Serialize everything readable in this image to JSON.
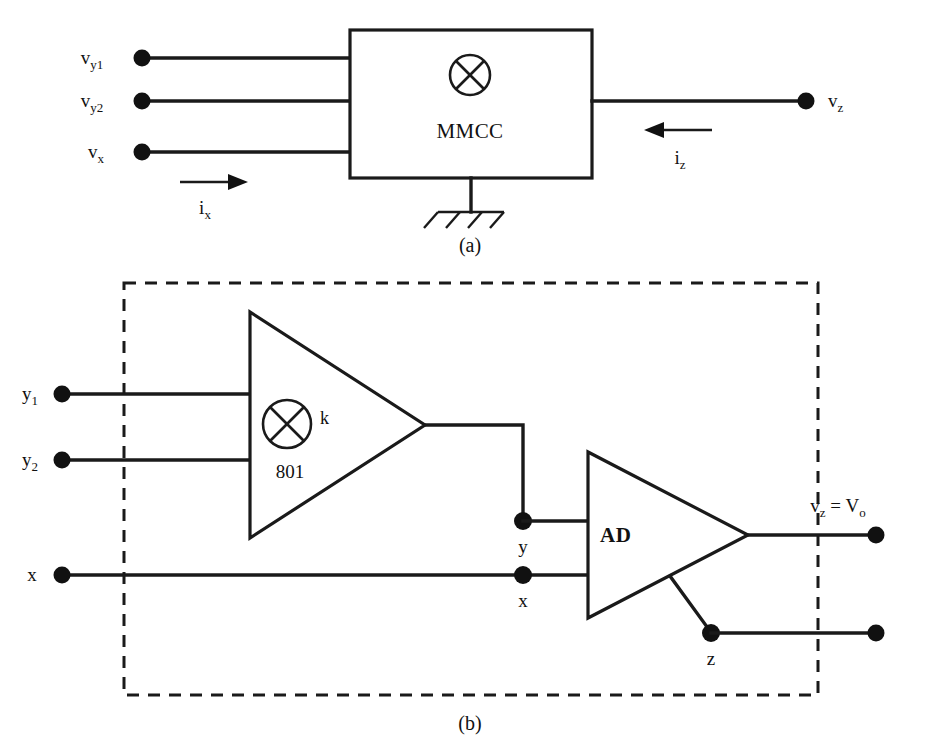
{
  "figure": {
    "panels": [
      {
        "id": "a",
        "caption": "(a)"
      },
      {
        "id": "b",
        "caption": "(b)"
      }
    ]
  },
  "panel_a": {
    "block_label": "MMCC",
    "multiplier_symbol": "circle-cross-multiplier",
    "ground_symbol": "chassis-ground",
    "inputs": [
      {
        "name": "v_y1",
        "base": "v",
        "sub": "y1"
      },
      {
        "name": "v_y2",
        "base": "v",
        "sub": "y2"
      },
      {
        "name": "v_x",
        "base": "v",
        "sub": "x"
      }
    ],
    "outputs": [
      {
        "name": "v_z",
        "base": "v",
        "sub": "z"
      }
    ],
    "currents": [
      {
        "name": "i_x",
        "base": "i",
        "sub": "x",
        "direction": "right"
      },
      {
        "name": "i_z",
        "base": "i",
        "sub": "z",
        "direction": "left"
      }
    ]
  },
  "panel_b": {
    "multiplier": {
      "gain_label": "k",
      "part_number": "801",
      "symbol": "circle-cross-multiplier"
    },
    "amplifier": {
      "label": "AD"
    },
    "inputs": [
      {
        "name": "y1",
        "base": "y",
        "sub": "1"
      },
      {
        "name": "y2",
        "base": "y",
        "sub": "2"
      },
      {
        "name": "x",
        "base": "x",
        "sub": ""
      }
    ],
    "internal_nodes": [
      {
        "name": "y",
        "base": "y",
        "sub": ""
      },
      {
        "name": "x",
        "base": "x",
        "sub": ""
      },
      {
        "name": "z",
        "base": "z",
        "sub": ""
      }
    ],
    "output_label": {
      "text": "v_z = V_o",
      "base1": "v",
      "sub1": "z",
      "equals": " = ",
      "base2": "V",
      "sub2": "o"
    }
  }
}
